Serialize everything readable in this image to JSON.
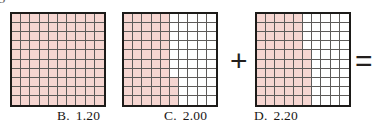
{
  "page": {
    "corner_mark": "5",
    "background_color": "#ffffff",
    "shade_color": "#f6d6d1",
    "grid_line_color": "#5d5b59",
    "border_color": "#1d1b19",
    "text_color": "#1a1715"
  },
  "operators": [
    {
      "name": "plus-sign",
      "symbol": "+"
    },
    {
      "name": "equals-sign",
      "symbol": "="
    }
  ],
  "grids": [
    {
      "name": "grid-square-1",
      "rows": 10,
      "columns": 10,
      "shaded_cells": 100,
      "value": 1.0,
      "description": "fully shaded unit square",
      "shaded_per_row": [
        10,
        10,
        10,
        10,
        10,
        10,
        10,
        10,
        10,
        10
      ]
    },
    {
      "name": "grid-square-2",
      "rows": 10,
      "columns": 10,
      "shaded_cells": 53,
      "value": 0.53,
      "description": "five full columns shaded plus sixth column shaded on bottom three rows",
      "shaded_per_row": [
        5,
        5,
        5,
        5,
        5,
        5,
        5,
        6,
        6,
        6
      ]
    },
    {
      "name": "grid-square-3",
      "rows": 10,
      "columns": 10,
      "shaded_cells": 56,
      "value": 0.56,
      "description": "six columns shaded with white notch in top four rows of sixth column",
      "shaded_per_row": [
        5,
        5,
        5,
        5,
        6,
        6,
        6,
        6,
        6,
        6
      ]
    }
  ],
  "choices": [
    {
      "name": "choice-b",
      "letter": "B.",
      "value": "1.20"
    },
    {
      "name": "choice-c",
      "letter": "C.",
      "value": "2.00"
    },
    {
      "name": "choice-d",
      "letter": "D.",
      "value": "2.20"
    }
  ]
}
